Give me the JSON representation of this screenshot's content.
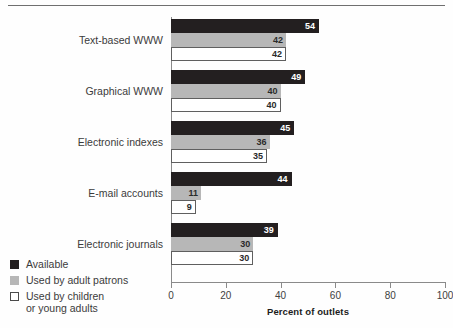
{
  "chart_data": {
    "type": "bar",
    "orientation": "horizontal",
    "title": "",
    "subtitle": "",
    "xlabel": "Percent of outlets",
    "ylabel": "",
    "xlim": [
      0,
      100
    ],
    "xticks": [
      0,
      20,
      40,
      60,
      80,
      100
    ],
    "xtick_labels": [
      "0",
      "20",
      "40",
      "60",
      "80",
      "100"
    ],
    "grid": false,
    "legend_position": "bottom-left",
    "categories": [
      "Text-based WWW",
      "Graphical WWW",
      "Electronic indexes",
      "E-mail accounts",
      "Electronic journals"
    ],
    "series": [
      {
        "name": "Available",
        "color": "#231f20",
        "values": [
          54,
          49,
          45,
          44,
          39
        ]
      },
      {
        "name": "Used by adult patrons",
        "color": "#b7b7b7",
        "values": [
          42,
          40,
          36,
          11,
          30
        ]
      },
      {
        "name": "Used by children\nor young adults",
        "color": "#ffffff",
        "values": [
          42,
          40,
          35,
          9,
          30
        ]
      }
    ]
  },
  "legend": {
    "items": [
      {
        "label": "Available",
        "swatch": "black-swatch"
      },
      {
        "label": "Used by adult patrons",
        "swatch": "gray-swatch"
      },
      {
        "label": "Used by children\nor young adults",
        "swatch": "white-swatch"
      }
    ]
  },
  "colors": {
    "series_available": "#231f20",
    "series_adult": "#b7b7b7",
    "series_children": "#ffffff",
    "axis": "#8a8a8a",
    "text": "#3b3b3b",
    "rule": "#6f6f6f"
  }
}
